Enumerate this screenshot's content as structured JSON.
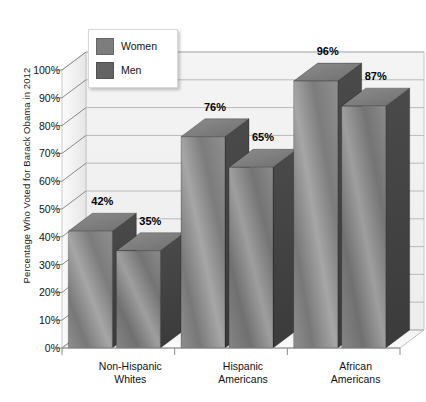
{
  "chart_data": {
    "type": "bar",
    "title": "",
    "subtitle": "",
    "xlabel": "",
    "ylabel": "Percentage Who Voted for Barack Obama in 2012",
    "ylim": [
      0,
      100
    ],
    "grid": true,
    "legend_position": "top-left",
    "style": "3d-grouped-bar",
    "categories": [
      "Non-Hispanic\nWhites",
      "Hispanic\nAmericans",
      "African\nAmericans"
    ],
    "category_lines": [
      [
        "Non-Hispanic",
        "Whites"
      ],
      [
        "Hispanic",
        "Americans"
      ],
      [
        "African",
        "Americans"
      ]
    ],
    "series": [
      {
        "name": "Women",
        "values": [
          42,
          76,
          96
        ],
        "color": "#7d7d7d"
      },
      {
        "name": "Men",
        "values": [
          35,
          65,
          87
        ],
        "color": "#6a6a6a"
      }
    ],
    "value_labels": [
      [
        "42%",
        "76%",
        "96%"
      ],
      [
        "35%",
        "65%",
        "87%"
      ]
    ],
    "ytick_labels": [
      "0%",
      "10%",
      "20%",
      "30%",
      "40%",
      "50%",
      "60%",
      "70%",
      "80%",
      "90%",
      "100%"
    ],
    "ytick_values": [
      0,
      10,
      20,
      30,
      40,
      50,
      60,
      70,
      80,
      90,
      100
    ]
  },
  "legend": {
    "items": [
      {
        "label": "Women",
        "color": "#7d7d7d"
      },
      {
        "label": "Men",
        "color": "#636363"
      }
    ]
  },
  "colors": {
    "plot_back": "#f1f1f1",
    "plot_side": "#e4e4e4",
    "floor": "#f7f7f7",
    "gridline": "#b9b9b9",
    "axis": "#8a8a8a",
    "text": "#111111"
  }
}
